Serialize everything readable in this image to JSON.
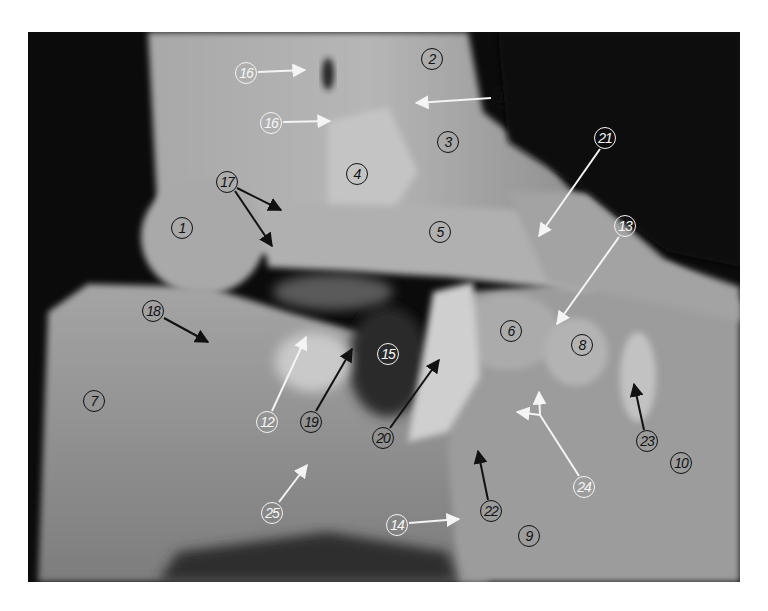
{
  "figure": {
    "colors": {
      "background": "#0b0b0b",
      "bone_light": "#b9b9b9",
      "bone_mid": "#9a9a9a",
      "shadow": "#3a3a3a",
      "label_dark": "#111111",
      "label_light": "#f4f4f4"
    }
  },
  "labels": [
    {
      "id": "1",
      "text": "1",
      "x": 182,
      "y": 228,
      "style": "dark"
    },
    {
      "id": "2",
      "text": "2",
      "x": 432,
      "y": 59,
      "style": "dark"
    },
    {
      "id": "3",
      "text": "3",
      "x": 448,
      "y": 142,
      "style": "dark"
    },
    {
      "id": "4",
      "text": "4",
      "x": 357,
      "y": 174,
      "style": "dark"
    },
    {
      "id": "5",
      "text": "5",
      "x": 440,
      "y": 232,
      "style": "dark"
    },
    {
      "id": "6",
      "text": "6",
      "x": 511,
      "y": 331,
      "style": "dark"
    },
    {
      "id": "7",
      "text": "7",
      "x": 94,
      "y": 401,
      "style": "dark"
    },
    {
      "id": "8",
      "text": "8",
      "x": 582,
      "y": 345,
      "style": "dark"
    },
    {
      "id": "9",
      "text": "9",
      "x": 529,
      "y": 536,
      "style": "dark"
    },
    {
      "id": "10",
      "text": "10",
      "x": 681,
      "y": 463,
      "style": "dark"
    },
    {
      "id": "11",
      "text": "11",
      "x": 503,
      "y": 97,
      "style": "dark"
    },
    {
      "id": "12",
      "text": "12",
      "x": 267,
      "y": 422,
      "style": "light"
    },
    {
      "id": "13",
      "text": "13",
      "x": 625,
      "y": 226,
      "style": "light"
    },
    {
      "id": "14",
      "text": "14",
      "x": 397,
      "y": 525,
      "style": "light"
    },
    {
      "id": "15",
      "text": "15",
      "x": 388,
      "y": 354,
      "style": "light"
    },
    {
      "id": "16a",
      "text": "16",
      "x": 246,
      "y": 73,
      "style": "light"
    },
    {
      "id": "16b",
      "text": "16",
      "x": 271,
      "y": 123,
      "style": "light"
    },
    {
      "id": "17",
      "text": "17",
      "x": 227,
      "y": 182,
      "style": "dark"
    },
    {
      "id": "18",
      "text": "18",
      "x": 153,
      "y": 311,
      "style": "dark"
    },
    {
      "id": "19",
      "text": "19",
      "x": 311,
      "y": 422,
      "style": "dark"
    },
    {
      "id": "20",
      "text": "20",
      "x": 383,
      "y": 438,
      "style": "dark"
    },
    {
      "id": "21",
      "text": "21",
      "x": 605,
      "y": 138,
      "style": "light"
    },
    {
      "id": "22",
      "text": "22",
      "x": 491,
      "y": 511,
      "style": "dark"
    },
    {
      "id": "23",
      "text": "23",
      "x": 647,
      "y": 441,
      "style": "dark"
    },
    {
      "id": "24",
      "text": "24",
      "x": 584,
      "y": 487,
      "style": "light"
    },
    {
      "id": "25",
      "text": "25",
      "x": 272,
      "y": 513,
      "style": "light"
    }
  ],
  "arrows": [
    {
      "from_label": "16a",
      "x1": 258,
      "y1": 72,
      "x2": 305,
      "y2": 70,
      "color": "#f4f4f4"
    },
    {
      "from_label": "16b",
      "x1": 283,
      "y1": 122,
      "x2": 330,
      "y2": 121,
      "color": "#f4f4f4"
    },
    {
      "from_label": "11",
      "x1": 491,
      "y1": 98,
      "x2": 416,
      "y2": 103,
      "color": "#f4f4f4"
    },
    {
      "from_label": "17",
      "x1": 237,
      "y1": 188,
      "x2": 281,
      "y2": 210,
      "color": "#111111"
    },
    {
      "from_label": "17",
      "x1": 235,
      "y1": 191,
      "x2": 272,
      "y2": 246,
      "color": "#111111"
    },
    {
      "from_label": "18",
      "x1": 164,
      "y1": 318,
      "x2": 208,
      "y2": 342,
      "color": "#111111"
    },
    {
      "from_label": "21",
      "x1": 600,
      "y1": 149,
      "x2": 539,
      "y2": 236,
      "color": "#f4f4f4"
    },
    {
      "from_label": "13",
      "x1": 619,
      "y1": 237,
      "x2": 557,
      "y2": 324,
      "color": "#f4f4f4"
    },
    {
      "from_label": "12",
      "x1": 272,
      "y1": 411,
      "x2": 306,
      "y2": 337,
      "color": "#f4f4f4"
    },
    {
      "from_label": "19",
      "x1": 316,
      "y1": 411,
      "x2": 352,
      "y2": 349,
      "color": "#111111"
    },
    {
      "from_label": "20",
      "x1": 390,
      "y1": 428,
      "x2": 439,
      "y2": 360,
      "color": "#111111"
    },
    {
      "from_label": "25",
      "x1": 279,
      "y1": 502,
      "x2": 307,
      "y2": 465,
      "color": "#f4f4f4"
    },
    {
      "from_label": "14",
      "x1": 409,
      "y1": 523,
      "x2": 459,
      "y2": 519,
      "color": "#f4f4f4"
    },
    {
      "from_label": "22",
      "x1": 488,
      "y1": 500,
      "x2": 478,
      "y2": 451,
      "color": "#111111"
    },
    {
      "from_label": "23",
      "x1": 644,
      "y1": 430,
      "x2": 634,
      "y2": 384,
      "color": "#111111"
    },
    {
      "from_label": "24",
      "x1": 579,
      "y1": 476,
      "x2": 540,
      "y2": 415,
      "color": "#f4f4f4"
    },
    {
      "from_label": "24",
      "x1": 540,
      "y1": 415,
      "x2": 539,
      "y2": 392,
      "color": "#f4f4f4"
    },
    {
      "from_label": "24",
      "x1": 540,
      "y1": 415,
      "x2": 517,
      "y2": 412,
      "color": "#f4f4f4"
    }
  ]
}
